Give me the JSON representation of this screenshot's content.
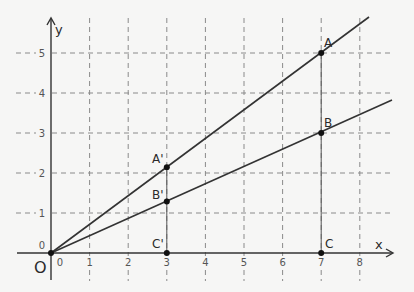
{
  "diagram": {
    "axes": {
      "x_label": "x",
      "y_label": "y",
      "origin_label": "O",
      "origin_x_tick": "0",
      "origin_y_tick": "0",
      "x_ticks": [
        "1",
        "2",
        "3",
        "4",
        "5",
        "6",
        "7",
        "8"
      ],
      "y_ticks": [
        "1",
        "2",
        "3",
        "4",
        "5"
      ]
    },
    "points": {
      "A": {
        "label": "A",
        "x": 7,
        "y": 5
      },
      "B": {
        "label": "B",
        "x": 7,
        "y": 3
      },
      "C": {
        "label": "C",
        "x": 7,
        "y": 0
      },
      "A_prime": {
        "label": "A'",
        "x": 3,
        "y": 2.14
      },
      "B_prime": {
        "label": "B'",
        "x": 3,
        "y": 1.29
      },
      "C_prime": {
        "label": "C'",
        "x": 3,
        "y": 0
      }
    },
    "lines": [
      {
        "name": "line-OA",
        "from": [
          0,
          0
        ],
        "through": [
          7,
          5
        ]
      },
      {
        "name": "line-OB",
        "from": [
          0,
          0
        ],
        "through": [
          7,
          3
        ]
      }
    ],
    "colors": {
      "background": "#f6f6f5",
      "line": "#333333",
      "grid": "#8a8a8a"
    }
  }
}
